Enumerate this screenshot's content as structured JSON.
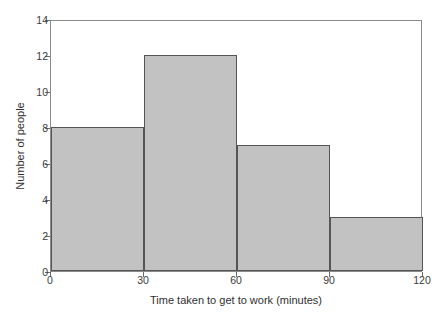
{
  "chart_data": {
    "type": "bar",
    "subtype": "histogram",
    "title": "",
    "xlabel": "Time taken to get to work (minutes)",
    "ylabel": "Number of people",
    "xlim": [
      0,
      120
    ],
    "ylim": [
      0,
      14
    ],
    "xticks": [
      "0",
      "30",
      "60",
      "90",
      "120"
    ],
    "yticks": [
      "0",
      "2",
      "4",
      "6",
      "8",
      "10",
      "12",
      "14"
    ],
    "bin_width": 30,
    "bin_edges": [
      0,
      30,
      60,
      90,
      120
    ],
    "categories": [
      "0-30",
      "30-60",
      "60-90",
      "90-120"
    ],
    "values": [
      8,
      12,
      7,
      3
    ],
    "grid": false,
    "legend": null,
    "bars": [
      {
        "label": "0-30",
        "start": 0,
        "end": 30,
        "value": 8
      },
      {
        "label": "30-60",
        "start": 30,
        "end": 60,
        "value": 12
      },
      {
        "label": "60-90",
        "start": 60,
        "end": 90,
        "value": 7
      },
      {
        "label": "90-120",
        "start": 90,
        "end": 120,
        "value": 3
      }
    ],
    "colors": {
      "bar_fill": "#c2c2c2",
      "bar_edge": "#555555",
      "axis_frame": "#8a8a8a",
      "tick": "#6b6b6b",
      "text": "#2f2f2f",
      "background": "#ffffff"
    }
  }
}
